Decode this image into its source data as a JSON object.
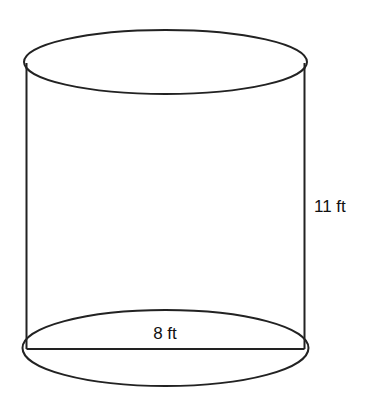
{
  "figure": {
    "shape": "cylinder",
    "stroke_color": "#222222",
    "background": "#ffffff",
    "labels": {
      "diameter": "8 ft",
      "height": "11 ft"
    }
  }
}
